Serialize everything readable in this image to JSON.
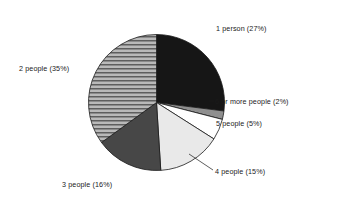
{
  "chart_data": {
    "type": "pie",
    "title": "",
    "subtitle": "",
    "xlabel": "",
    "ylabel": "",
    "legend_position": "none",
    "grid": false,
    "label_format": "{category}  ({value}%)",
    "start_angle_deg": 0,
    "direction": "clockwise",
    "categories": [
      "1 person",
      "6 or more people",
      "5 people",
      "4 people",
      "3 people",
      "2 people"
    ],
    "values": [
      27,
      2,
      5,
      15,
      16,
      35
    ],
    "total": 100,
    "unit": "%",
    "slices": [
      {
        "category": "1 person",
        "value": 27,
        "label": "1 person  (27%)",
        "fill_style": "solid",
        "color": "#161616",
        "start_deg": 0,
        "end_deg": 97.2
      },
      {
        "category": "6 or more people",
        "value": 2,
        "label": "6 or more people  (2%)",
        "fill_style": "solid",
        "color": "#8f8f8f",
        "start_deg": 97.2,
        "end_deg": 104.4
      },
      {
        "category": "5 people",
        "value": 5,
        "label": "5 people  (5%)",
        "fill_style": "solid",
        "color": "#ffffff",
        "start_deg": 104.4,
        "end_deg": 122.4
      },
      {
        "category": "4 people",
        "value": 15,
        "label": "4 people  (15%)",
        "fill_style": "solid",
        "color": "#e9e9e9",
        "start_deg": 122.4,
        "end_deg": 176.4
      },
      {
        "category": "3 people",
        "value": 16,
        "label": "3 people  (16%)",
        "fill_style": "solid",
        "color": "#474747",
        "start_deg": 176.4,
        "end_deg": 234.0
      },
      {
        "category": "2 people",
        "value": 35,
        "label": "2 people  (35%)",
        "fill_style": "horizontal-stripes",
        "color": "#b4b4b4",
        "stripe_color": "#5a5a5a",
        "start_deg": 234.0,
        "end_deg": 360.0
      }
    ]
  },
  "labels": {
    "one_person": "1 person  (27%)",
    "six_or_more": "6 or more people  (2%)",
    "five_people": "5 people  (5%)",
    "four_people": "4 people  (15%)",
    "three_people": "3 people  (16%)",
    "two_people": "2 people  (35%)"
  },
  "colors": {
    "outline": "#1a1a1a",
    "text": "#1a1a1a",
    "background": "#ffffff"
  }
}
